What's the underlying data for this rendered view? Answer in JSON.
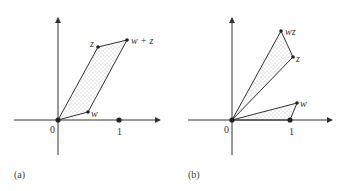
{
  "panels": [
    {
      "caption": "(a)",
      "origin_label": "0",
      "unit_label": "1",
      "points": {
        "z": "z",
        "w_plus_z": "w + z",
        "w": "w"
      },
      "description": "Parallelogram with vertices 0, w, w+z, z (vector addition)"
    },
    {
      "caption": "(b)",
      "origin_label": "0",
      "unit_label": "1",
      "points": {
        "wz": "wz",
        "z": "z",
        "w": "w"
      },
      "description": "Similar triangles 0-1-w and 0-z-wz (complex multiplication)"
    }
  ],
  "colors": {
    "line": "#333333",
    "fill_dots": "#666666",
    "background": "#ffffff"
  }
}
